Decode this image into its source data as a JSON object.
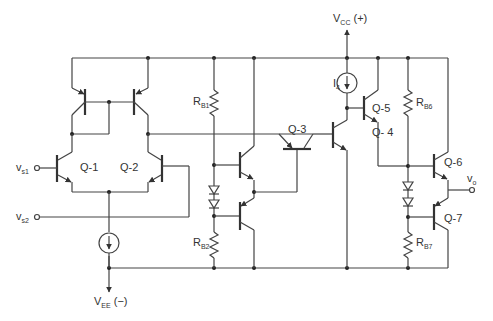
{
  "diagram": {
    "type": "circuit-schematic",
    "supply": {
      "vcc_label": "V",
      "vcc_sub": "CC",
      "vcc_suffix": " (+)",
      "vee_label": "V",
      "vee_sub": "EE",
      "vee_suffix": " (−)"
    },
    "inputs": [
      {
        "label": "v",
        "sub": "s1"
      },
      {
        "label": "v",
        "sub": "s2"
      }
    ],
    "output": {
      "label": "v",
      "sub": "o"
    },
    "transistors": [
      {
        "id": "Q-1",
        "label": "Q-1",
        "type": "npn"
      },
      {
        "id": "Q-2",
        "label": "Q-2",
        "type": "npn"
      },
      {
        "id": "Q-3",
        "label": "Q-3",
        "type": "pnp"
      },
      {
        "id": "Q-4",
        "label": "Q- 4",
        "type": "pnp"
      },
      {
        "id": "Q-5",
        "label": "Q-5",
        "type": "npn"
      },
      {
        "id": "Q-6",
        "label": "Q-6",
        "type": "npn"
      },
      {
        "id": "Q-7",
        "label": "Q-7",
        "type": "pnp"
      }
    ],
    "resistors": [
      {
        "id": "RB1",
        "label": "R",
        "sub": "B1"
      },
      {
        "id": "RB2",
        "label": "R",
        "sub": "B2"
      },
      {
        "id": "RB6",
        "label": "R",
        "sub": "B6"
      },
      {
        "id": "RB7",
        "label": "R",
        "sub": "B7"
      }
    ],
    "current_sources": [
      {
        "id": "I4",
        "label": "I",
        "sub": "4"
      },
      {
        "id": "Itail",
        "label": ""
      }
    ]
  }
}
